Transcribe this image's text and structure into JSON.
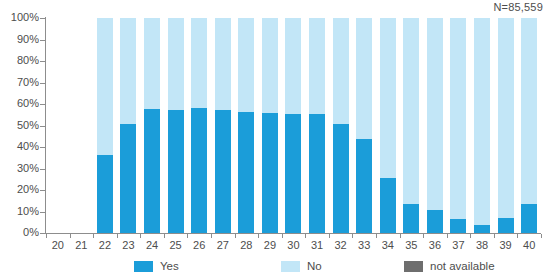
{
  "annotation": {
    "n_label": "N=85,559"
  },
  "legend": {
    "position": "bottom",
    "items": [
      {
        "label": "Yes",
        "color": "#1b9dd9"
      },
      {
        "label": "No",
        "color": "#c2e6f7"
      },
      {
        "label": "not available",
        "color": "#6e6e6e"
      }
    ]
  },
  "axes": {
    "y_ticks": [
      "0%",
      "10%",
      "20%",
      "30%",
      "40%",
      "50%",
      "60%",
      "70%",
      "80%",
      "90%",
      "100%"
    ],
    "x_ticks": [
      "20",
      "21",
      "22",
      "23",
      "24",
      "25",
      "26",
      "27",
      "28",
      "29",
      "30",
      "31",
      "32",
      "33",
      "34",
      "35",
      "36",
      "37",
      "38",
      "39",
      "40"
    ]
  },
  "chart_data": {
    "type": "bar",
    "stacked": true,
    "percent": true,
    "title": "",
    "subtitle": "",
    "xlabel": "",
    "ylabel": "",
    "ylim": [
      0,
      100
    ],
    "grid": false,
    "legend_position": "bottom",
    "annotations": [
      "N=85,559"
    ],
    "categories": [
      "20",
      "21",
      "22",
      "23",
      "24",
      "25",
      "26",
      "27",
      "28",
      "29",
      "30",
      "31",
      "32",
      "33",
      "34",
      "35",
      "36",
      "37",
      "38",
      "39",
      "40"
    ],
    "series": [
      {
        "name": "Yes",
        "color": "#1b9dd9",
        "values": [
          0,
          0,
          36.5,
          50.5,
          57.5,
          57,
          58,
          57,
          56.5,
          56,
          55.5,
          55.5,
          50.5,
          43.5,
          25.5,
          13.5,
          10.5,
          6.5,
          3.5,
          7,
          13.5
        ]
      },
      {
        "name": "No",
        "color": "#c2e6f7",
        "values": [
          0,
          0,
          63.5,
          49.5,
          42.5,
          43,
          42,
          43,
          43.5,
          44,
          44.5,
          44.5,
          49.5,
          56.5,
          74.5,
          86.5,
          89.5,
          93.5,
          96.5,
          93,
          86.5
        ]
      },
      {
        "name": "not available",
        "color": "#6e6e6e",
        "values": [
          0,
          0,
          0,
          0,
          0,
          0,
          0,
          0,
          0,
          0,
          0,
          0,
          0,
          0,
          0,
          0,
          0,
          0,
          0,
          0,
          0
        ]
      }
    ],
    "empty_categories": [
      "20",
      "21"
    ]
  },
  "layout": {
    "plot_left": 46,
    "plot_top": 18,
    "plot_width": 495,
    "plot_height": 215,
    "slot_width": 23.571,
    "bar_width": 16
  }
}
